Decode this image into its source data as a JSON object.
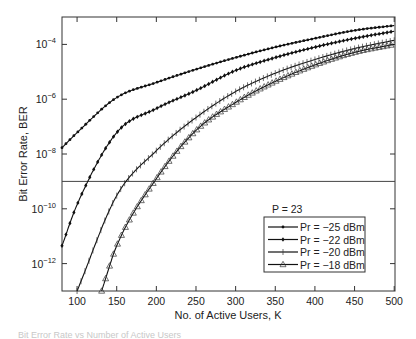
{
  "chart_data": {
    "type": "line",
    "title": "",
    "xlabel": "No. of Active Users, K",
    "ylabel": "Bit Error Rate, BER",
    "yscale": "log",
    "xlim": [
      81,
      501
    ],
    "ylim_log10": [
      -13.0,
      -3.0
    ],
    "x_ticks": [
      100,
      150,
      200,
      250,
      300,
      350,
      400,
      450,
      500
    ],
    "x_tick_labels": [
      "100",
      "150",
      "200",
      "250",
      "300",
      "350",
      "400",
      "450",
      "500"
    ],
    "y_ticks_log10": [
      -4,
      -6,
      -8,
      -10,
      -12
    ],
    "y_tick_labels": [
      {
        "base": "10",
        "exp": "−4"
      },
      {
        "base": "10",
        "exp": "−6"
      },
      {
        "base": "10",
        "exp": "−8"
      },
      {
        "base": "10",
        "exp": "−10"
      },
      {
        "base": "10",
        "exp": "−12"
      }
    ],
    "grid": false,
    "reference_line": {
      "log10_y": -9.0,
      "label": ""
    },
    "legend": {
      "position": "lower right",
      "title": "P = 23",
      "entries": [
        "Pr = −25 dBm",
        "Pr = −22 dBm",
        "Pr = −20 dBm",
        "Pr = −18 dBm"
      ]
    },
    "x": [
      81,
      100,
      150,
      200,
      250,
      300,
      350,
      400,
      450,
      500
    ],
    "series": [
      {
        "name": "Pr = −25 dBm",
        "marker": "dot",
        "log10_values": [
          -7.77,
          -7.22,
          -5.94,
          -5.39,
          -4.91,
          -4.48,
          -4.1,
          -3.78,
          -3.49,
          -3.31
        ]
      },
      {
        "name": "Pr = −22 dBm",
        "marker": "diamond",
        "log10_values": [
          -11.35,
          -9.85,
          -7.22,
          -6.34,
          -5.68,
          -4.95,
          -4.48,
          -4.1,
          -3.78,
          -3.52
        ]
      },
      {
        "name": "Pr = −20 dBm",
        "marker": "plus",
        "log10_values": [
          null,
          -12.8,
          -9.52,
          -7.88,
          -6.67,
          -5.72,
          -5.05,
          -4.55,
          -4.15,
          -3.85
        ]
      },
      {
        "name": "Pr = −18 dBm",
        "marker": "triangle",
        "log10_values": [
          null,
          null,
          -11.35,
          -8.9,
          -7.14,
          -6.12,
          -5.35,
          -4.75,
          -4.29,
          -4.0
        ]
      }
    ],
    "series_start_x": [
      81,
      81,
      100,
      131
    ],
    "series_start_log10": [
      -7.77,
      -11.35,
      -13.0,
      -13.0
    ]
  },
  "caption": "Bit Error Rate vs Number of Active Users"
}
